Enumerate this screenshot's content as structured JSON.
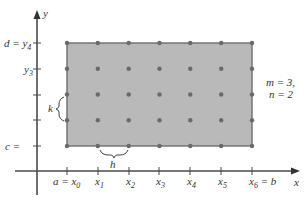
{
  "diagram": {
    "colors": {
      "region_fill": "#b9b9b9",
      "region_border": "#6e6e6e",
      "point": "#6a6a6a",
      "axis": "#4a4a4a",
      "text": "#333333"
    },
    "axes": {
      "x_label": "x",
      "y_label": "y"
    },
    "x_ticks": [
      {
        "name": "x0",
        "label_pre": "a = x",
        "sub": "0",
        "post": ""
      },
      {
        "name": "x1",
        "label_pre": "x",
        "sub": "1",
        "post": ""
      },
      {
        "name": "x2",
        "label_pre": "x",
        "sub": "2",
        "post": ""
      },
      {
        "name": "x3",
        "label_pre": "x",
        "sub": "3",
        "post": ""
      },
      {
        "name": "x4",
        "label_pre": "x",
        "sub": "4",
        "post": ""
      },
      {
        "name": "x5",
        "label_pre": "x",
        "sub": "5",
        "post": ""
      },
      {
        "name": "x6",
        "label_pre": "x",
        "sub": "6",
        "post": " = b"
      }
    ],
    "y_ticks": [
      {
        "name": "y4",
        "label_pre": "d = y",
        "sub": "4"
      },
      {
        "name": "y3",
        "label_pre": "y",
        "sub": "3"
      },
      {
        "name": "y2",
        "label_pre": "",
        "sub": ""
      },
      {
        "name": "y1",
        "label_pre": "",
        "sub": ""
      },
      {
        "name": "y0",
        "label_pre": "c =",
        "sub": ""
      }
    ],
    "spacing_labels": {
      "h": "h",
      "k": "k"
    },
    "parameters": {
      "line1": "m = 3,",
      "line2": "n = 2"
    },
    "grid": {
      "columns": 7,
      "rows": 5
    }
  }
}
